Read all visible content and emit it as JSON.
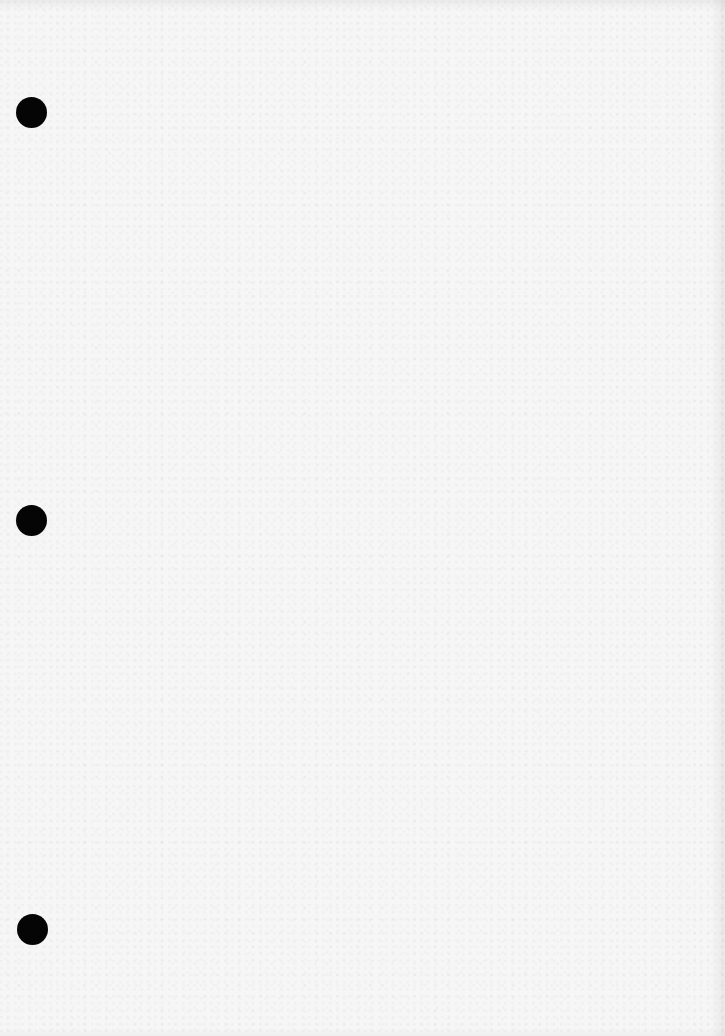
{
  "document": {
    "type": "blank three-hole-punched sheet",
    "text_content": "",
    "paper_color": "#f6f6f6",
    "hole_color": "#050505",
    "punch_holes": [
      {
        "cx": 31,
        "cy": 112,
        "diameter": 31
      },
      {
        "cx": 31,
        "cy": 520,
        "diameter": 31
      },
      {
        "cx": 32,
        "cy": 929,
        "diameter": 31
      }
    ]
  }
}
